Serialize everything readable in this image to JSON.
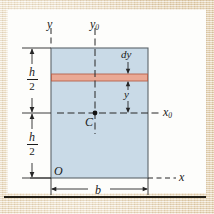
{
  "figure": {
    "kind": "rectangular-cross-section-centroid-diagram",
    "colors": {
      "section_fill": "#c9dae7",
      "section_stroke": "#5b646b",
      "strip_fill": "#eaa995",
      "strip_stroke": "#b5614b",
      "axis_line": "#262626",
      "paper": "#e6d6b8",
      "canvas": "#fdfdfb",
      "rule": "#231f16"
    }
  },
  "labels": {
    "axis_y": "y",
    "axis_y0": "y",
    "axis_y0_sub": "0",
    "axis_x": "x",
    "axis_x0": "x",
    "axis_x0_sub": "0",
    "origin": "O",
    "centroid": "C",
    "strip_thickness": "dy",
    "strip_distance": "y",
    "width": "b",
    "half_height_num": "h",
    "half_height_den": "2"
  },
  "dimensions": {
    "upper_half_height": "h/2",
    "lower_half_height": "h/2",
    "total_width": "b",
    "strip_thickness": "dy",
    "strip_offset_from_centroidal_axis": "y"
  },
  "geometry": {
    "rect_left": 51,
    "rect_right": 148,
    "rect_top": 48,
    "rect_bottom": 178,
    "centroid_x": 95,
    "centroid_y": 113,
    "strip_top": 74,
    "strip_bottom": 81
  }
}
